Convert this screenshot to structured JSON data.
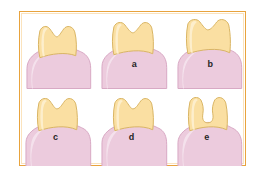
{
  "figure": {
    "frame": {
      "outer_color": "#e8a33d",
      "inner_color": "#fbe3bd",
      "background": "#ffffff"
    },
    "colors": {
      "crown_fill": "#fadfa2",
      "crown_stroke": "#d9b463",
      "crown_highlight": "#fdf0d0",
      "gingiva_fill": "#eccbdd",
      "gingiva_stroke": "#d8a8c4",
      "gingiva_highlight": "#f6e5ef",
      "cavity_fill": "#fdfaf3",
      "label_color": "#262626"
    },
    "panels": [
      {
        "id": "panel-0",
        "label": "",
        "name": "tooth-diagram-unlabeled",
        "description": "Tooth with crown partially covered by gingiva, gingival margin high on crown"
      },
      {
        "id": "panel-a",
        "label": "a",
        "name": "tooth-diagram-a",
        "description": "Tooth with crown exposed, gingival margin at cervical line"
      },
      {
        "id": "panel-b",
        "label": "b",
        "name": "tooth-diagram-b",
        "description": "Tooth with taller exposed crown, gingival recession"
      },
      {
        "id": "panel-c",
        "label": "c",
        "name": "tooth-diagram-c",
        "description": "Tooth with crown and sloping gingival margin"
      },
      {
        "id": "panel-d",
        "label": "d",
        "name": "tooth-diagram-d",
        "description": "Tooth with crown and steeper gingival slope"
      },
      {
        "id": "panel-e",
        "label": "e",
        "name": "tooth-diagram-e",
        "description": "Tooth with central occlusal cavity notch in crown"
      }
    ]
  }
}
